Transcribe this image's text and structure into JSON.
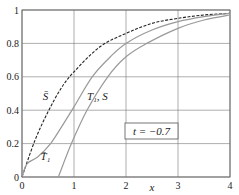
{
  "chart_data": {
    "type": "line",
    "title": "",
    "xlabel": "x",
    "ylabel": "",
    "xlim": [
      0,
      4
    ],
    "ylim": [
      0,
      1
    ],
    "grid": true,
    "xticks": [
      "0",
      "1",
      "2",
      "3",
      "4"
    ],
    "yticks": [
      "0",
      "0.2",
      "0.4",
      "0.6",
      "0.8",
      "1"
    ],
    "annotation": "t = −0.7",
    "series": [
      {
        "name": "S̄",
        "style": "dashed",
        "color": "#222222",
        "x": [
          0,
          0.25,
          0.5,
          0.75,
          1,
          1.5,
          2,
          2.5,
          3,
          3.5,
          4
        ],
        "y": [
          0,
          0.22,
          0.39,
          0.53,
          0.63,
          0.78,
          0.86,
          0.92,
          0.95,
          0.97,
          0.98
        ]
      },
      {
        "name": "T̄₁",
        "style": "solid",
        "color": "#999999",
        "x": [
          0,
          0.1,
          0.3,
          0.55,
          0.8,
          1,
          1.35,
          1.7,
          2,
          2.5,
          3,
          3.5,
          4
        ],
        "y": [
          0,
          0.08,
          0.12,
          0.2,
          0.32,
          0.42,
          0.6,
          0.72,
          0.8,
          0.88,
          0.93,
          0.96,
          0.98
        ]
      },
      {
        "name": "T₁, S",
        "style": "solid",
        "color": "#999999",
        "x": [
          0.7,
          0.95,
          1.25,
          1.65,
          2,
          2.4,
          3,
          3.5,
          4
        ],
        "y": [
          0,
          0.2,
          0.4,
          0.6,
          0.72,
          0.8,
          0.89,
          0.94,
          0.97
        ]
      }
    ],
    "labels": [
      {
        "text": "S̄",
        "x": 0.45,
        "y": 0.46
      },
      {
        "text": "T̄₁",
        "x": 0.45,
        "y": 0.1
      },
      {
        "text": "T₁, S",
        "x": 1.45,
        "y": 0.46
      }
    ]
  }
}
